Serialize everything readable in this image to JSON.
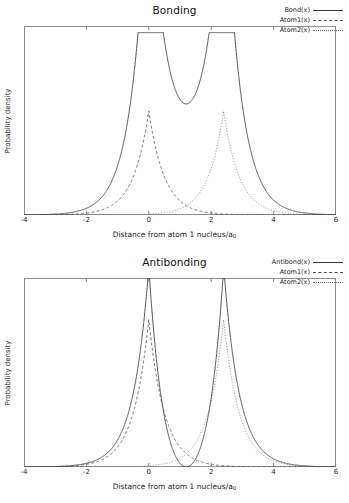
{
  "figure": {
    "background": "#ffffff",
    "frame_color": "#8d8d8d",
    "axis_title": "Distance from atom 1 nucleus/a",
    "axis_title_subscript": "0",
    "ylabel": "Probability density"
  },
  "chart_data": [
    {
      "type": "line",
      "title": "Bonding",
      "xlabel": "Distance from atom 1 nucleus/a0",
      "ylabel": "Probability density",
      "xlim": [
        -4,
        6
      ],
      "ylim": [
        0,
        1
      ],
      "xticks": [
        -4,
        -2,
        0,
        2,
        4,
        6
      ],
      "xtick_labels": [
        "-4",
        "-2",
        "0",
        "2",
        "4",
        "6"
      ],
      "yticks": [],
      "grid": false,
      "legend_position": "top-right",
      "nuclei": [
        0,
        2.4
      ],
      "series": [
        {
          "name": "Bond(x)",
          "style": "solid",
          "color": "#3c3c3c",
          "kind": "molecular",
          "sign": 1,
          "amplitude": 1.62,
          "clip_top": 0.965,
          "comment": "Squared sum of two 1s orbitals; plateau clipped at frame top between nuclei, cusps to zero at each nucleus"
        },
        {
          "name": "Atom1(x)",
          "style": "dashed",
          "color": "#4a4a4a",
          "kind": "atomic",
          "center": 0,
          "amplitude": 0.55
        },
        {
          "name": "Atom2(x)",
          "style": "dotted",
          "color": "#6a6a6a",
          "kind": "atomic",
          "center": 2.4,
          "amplitude": 0.55
        }
      ]
    },
    {
      "type": "line",
      "title": "Antibonding",
      "xlabel": "Distance from atom 1 nucleus/a0",
      "ylabel": "Probability density",
      "xlim": [
        -4,
        6
      ],
      "ylim": [
        0,
        1
      ],
      "xticks": [
        -4,
        -2,
        0,
        2,
        4,
        6
      ],
      "xtick_labels": [
        "-4",
        "-2",
        "0",
        "2",
        "4",
        "6"
      ],
      "yticks": [],
      "grid": false,
      "legend_position": "top-right",
      "nuclei": [
        0,
        2.4
      ],
      "node": 1.2,
      "series": [
        {
          "name": "Antibond(x)",
          "style": "solid",
          "color": "#3c3c3c",
          "kind": "molecular",
          "sign": -1,
          "amplitude": 1.28,
          "clip_top": 1.0,
          "comment": "Squared difference of two 1s orbitals; node at midpoint x=1.2, large outer lobes"
        },
        {
          "name": "Atom1(x)",
          "style": "dashed",
          "color": "#4a4a4a",
          "kind": "atomic",
          "center": 0,
          "amplitude": 0.78
        },
        {
          "name": "Atom2(x)",
          "style": "dotted",
          "color": "#6a6a6a",
          "kind": "atomic",
          "center": 2.4,
          "amplitude": 0.78
        }
      ]
    }
  ],
  "panels": [
    {
      "title": "Bonding",
      "legend": [
        {
          "label": "Bond(x)",
          "key": "solid"
        },
        {
          "label": "Atom1(x)",
          "key": "dash"
        },
        {
          "label": "Atom2(x)",
          "key": "dot"
        }
      ]
    },
    {
      "title": "Antibonding",
      "legend": [
        {
          "label": "Antibond(x)",
          "key": "solid"
        },
        {
          "label": "Atom1(x)",
          "key": "dash"
        },
        {
          "label": "Atom2(x)",
          "key": "dot"
        }
      ]
    }
  ]
}
